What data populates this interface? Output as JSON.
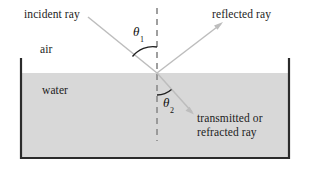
{
  "figure": {
    "media": {
      "upper_label": "air",
      "lower_label": "water"
    },
    "rays": {
      "incident": "incident ray",
      "reflected": "reflected ray",
      "transmitted_line1": "transmitted or",
      "transmitted_line2": "refracted ray"
    },
    "angles": {
      "theta1_symbol": "θ",
      "theta1_subscript": "1",
      "theta2_symbol": "θ",
      "theta2_subscript": "2"
    },
    "colors": {
      "background": "#ffffff",
      "water_fill": "#d8d8d8",
      "container_line": "#2b2b2b",
      "ray_line": "#b9b9b9",
      "normal_line": "#8f8f8f",
      "arc_line": "#1f1f1f",
      "text": "#1c1c1c"
    }
  }
}
